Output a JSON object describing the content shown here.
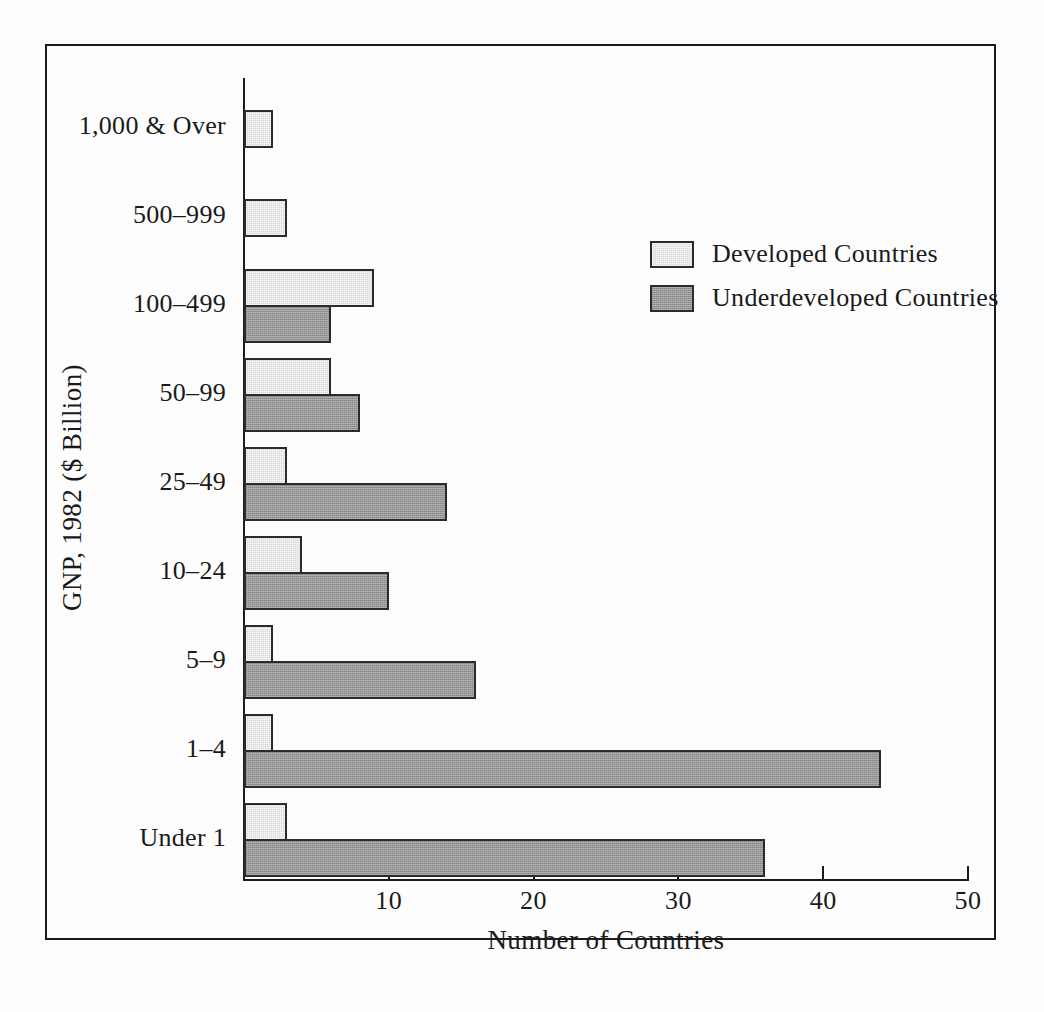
{
  "chart_data": {
    "type": "bar",
    "orientation": "horizontal",
    "title": "",
    "xlabel": "Number of Countries",
    "ylabel": "GNP, 1982 ($ Billion)",
    "xlim": [
      0,
      50
    ],
    "xticks": [
      0,
      10,
      20,
      30,
      40,
      50
    ],
    "xtick_labels": [
      "",
      "10",
      "20",
      "30",
      "40",
      "50"
    ],
    "grid": false,
    "legend_position": "upper right inside",
    "categories": [
      "1,000 & Over",
      "500–999",
      "100–499",
      "50–99",
      "25–49",
      "10–24",
      "5–9",
      "1–4",
      "Under 1"
    ],
    "series": [
      {
        "name": "Developed Countries",
        "color": "#d8d8d8",
        "values": [
          2,
          3,
          9,
          6,
          3,
          4,
          2,
          2,
          3
        ]
      },
      {
        "name": "Underdeveloped Countries",
        "color": "#969696",
        "values": [
          0,
          0,
          6,
          8,
          14,
          10,
          16,
          44,
          36
        ]
      }
    ]
  },
  "axis": {
    "x_title": "Number of Countries",
    "y_title": "GNP, 1982 ($ Billion)",
    "x_ticks": [
      {
        "value": 10,
        "label": "10"
      },
      {
        "value": 20,
        "label": "20"
      },
      {
        "value": 30,
        "label": "30"
      },
      {
        "value": 40,
        "label": "40"
      },
      {
        "value": 50,
        "label": "50"
      }
    ]
  },
  "legend": {
    "items": [
      {
        "label": "Developed  Countries",
        "swatch": "light-gray-swatch"
      },
      {
        "label": "Underdeveloped  Countries",
        "swatch": "dark-gray-swatch"
      }
    ]
  },
  "category_labels": [
    "1,000 & Over",
    "500–999",
    "100–499",
    "50–99",
    "25–49",
    "10–24",
    "5–9",
    "1–4",
    "Under 1"
  ]
}
